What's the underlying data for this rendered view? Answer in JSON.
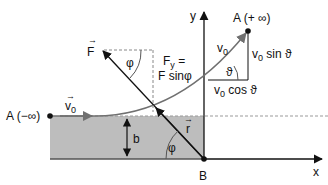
{
  "diagram": {
    "type": "physics-scattering-geometry",
    "colors": {
      "region_fill": "#bdbdbd",
      "line": "#111111",
      "trajectory": "#707070",
      "dashed": "#888888",
      "background": "#ffffff"
    },
    "axes": {
      "x_label": "x",
      "y_label": "y"
    },
    "points": {
      "a_minus": {
        "label": "A (−∞)"
      },
      "a_plus": {
        "label": "A (+ ∞)"
      },
      "b": {
        "label": "B"
      }
    },
    "labels": {
      "v0_vector": "v",
      "v0_vector_sub": "0",
      "force_vector": "F",
      "phi_top": "φ",
      "fy_line1": "F",
      "fy_line1_sub": "y",
      "fy_line1_rest": " =",
      "fy_line2": "F sinφ",
      "v0_final": "v",
      "v0_final_sub": "0",
      "v0_sin": "v",
      "v0_sin_sub": "0",
      "v0_sin_rest": " sin ϑ",
      "v0_cos": "v",
      "v0_cos_sub": "0",
      "v0_cos_rest": " cos ϑ",
      "theta": "ϑ",
      "impact_parameter": "b",
      "r_vector": "r",
      "phi_bottom": "φ",
      "vec_arrow": "→"
    }
  }
}
